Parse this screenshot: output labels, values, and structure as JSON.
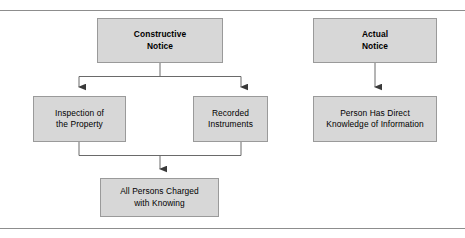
{
  "diagram": {
    "style": {
      "box_fill": "#d7d7d7",
      "box_border": "#9a9a9a",
      "connector_color": "#555555",
      "rule_color": "#8d8d8d",
      "page_background": "#ffffff",
      "text_color": "#000000"
    },
    "nodes": [
      {
        "id": "constructive-notice",
        "label": "Constructive\nNotice",
        "bold": true,
        "column": "left",
        "level": 1
      },
      {
        "id": "actual-notice",
        "label": "Actual\nNotice",
        "bold": true,
        "column": "right",
        "level": 1
      },
      {
        "id": "inspection-of-the-property",
        "label": "Inspection of\nthe Property",
        "bold": false,
        "column": "left",
        "level": 2
      },
      {
        "id": "recorded-instruments",
        "label": "Recorded\nInstruments",
        "bold": false,
        "column": "left",
        "level": 2
      },
      {
        "id": "person-has-direct-knowledge",
        "label": "Person Has Direct\nKnowledge of Information",
        "bold": false,
        "column": "right",
        "level": 2
      },
      {
        "id": "all-persons-charged-with-knowing",
        "label": "All Persons Charged\nwith Knowing",
        "bold": false,
        "column": "left",
        "level": 3
      }
    ],
    "edges": [
      {
        "from": "constructive-notice",
        "to": "inspection-of-the-property",
        "type": "fork",
        "arrow": true
      },
      {
        "from": "constructive-notice",
        "to": "recorded-instruments",
        "type": "fork",
        "arrow": true
      },
      {
        "from": "inspection-of-the-property",
        "to": "all-persons-charged-with-knowing",
        "type": "merge",
        "arrow": true
      },
      {
        "from": "recorded-instruments",
        "to": "all-persons-charged-with-knowing",
        "type": "merge",
        "arrow": true
      },
      {
        "from": "actual-notice",
        "to": "person-has-direct-knowledge",
        "type": "straight",
        "arrow": true
      }
    ],
    "rules": [
      {
        "id": "rule-top",
        "position": "top"
      },
      {
        "id": "rule-bottom",
        "position": "bottom"
      }
    ]
  }
}
